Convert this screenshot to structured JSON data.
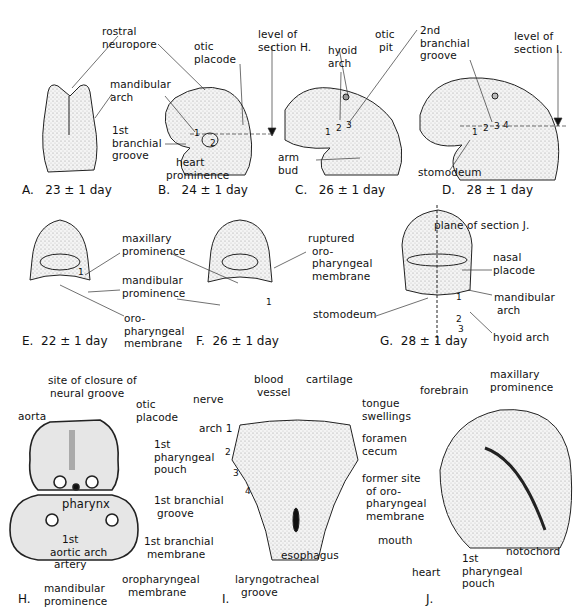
{
  "figure": {
    "panels": [
      {
        "id": "A",
        "caption": "A.",
        "age": "23 ± 1 day",
        "labels": {
          "rostral_neuropore": [
            "rostral",
            "neuropore"
          ],
          "mandibular_arch": [
            "mandibular",
            "arch"
          ]
        }
      },
      {
        "id": "B",
        "caption": "B.",
        "age": "24 ± 1 day",
        "labels": {
          "otic_placode": [
            "otic",
            "placode"
          ],
          "level_of_section": [
            "level of",
            "section H."
          ],
          "first_branchial_groove": [
            "1st",
            "branchial",
            "groove"
          ],
          "heart_prominence": [
            "heart",
            "prominence"
          ]
        },
        "arch_numbers": [
          "1",
          "2"
        ]
      },
      {
        "id": "C",
        "caption": "C.",
        "age": "26 ± 1 day",
        "labels": {
          "hyoid_arch": [
            "hyoid",
            "arch"
          ],
          "otic_pit": [
            "otic",
            "pit"
          ],
          "arm_bud": [
            "arm",
            "bud"
          ]
        },
        "arch_numbers": [
          "1",
          "2",
          "3"
        ]
      },
      {
        "id": "D",
        "caption": "D.",
        "age": "28 ± 1 day",
        "labels": {
          "second_branchial_groove": [
            "2nd",
            "branchial",
            "groove"
          ],
          "level_of_section": [
            "level of",
            "section I."
          ],
          "stomodeum": "stomodeum"
        },
        "arch_numbers": [
          "1",
          "2",
          "3",
          "4"
        ]
      },
      {
        "id": "E",
        "caption": "E.",
        "age": "22 ± 1 day",
        "labels": {
          "maxillary_prominence": [
            "maxillary",
            "prominence"
          ],
          "mandibular_prominence": [
            "mandibular",
            "prominence"
          ],
          "oropharyngeal_membrane": [
            "oro-",
            "pharyngeal",
            "membrane"
          ]
        },
        "arch_numbers": [
          "1"
        ]
      },
      {
        "id": "F",
        "caption": "F.",
        "age": "26 ± 1 day",
        "labels": {
          "ruptured_membrane": [
            "ruptured",
            "oro-",
            "pharyngeal",
            "membrane"
          ]
        },
        "arch_numbers": [
          "1"
        ]
      },
      {
        "id": "G",
        "caption": "G.",
        "age": "28 ± 1 day",
        "labels": {
          "plane_of_section": "plane   of section J.",
          "nasal_placode": [
            "nasal",
            "placode"
          ],
          "mandibular_arch": [
            "mandibular",
            "arch"
          ],
          "stomodeum": "stomodeum",
          "hyoid_arch": "hyoid arch"
        },
        "arch_numbers": [
          "1",
          "2",
          "3"
        ]
      },
      {
        "id": "H",
        "caption": "H.",
        "labels": {
          "site_closure": [
            "site of closure of",
            "neural groove"
          ],
          "aorta": "aorta",
          "otic_placode": [
            "otic",
            "placode"
          ],
          "first_pharyngeal_pouch": [
            "1st",
            "pharyngeal",
            "pouch"
          ],
          "pharynx": "pharynx",
          "first_branchial_groove": [
            "1st branchial",
            "groove"
          ],
          "first_branchial_membrane": [
            "1st branchial",
            "membrane"
          ],
          "first_aortic_arch_artery": [
            "1st",
            "aortic arch",
            "artery"
          ],
          "oropharyngeal_membrane": [
            "oropharyngeal",
            "membrane"
          ],
          "mandibular_prominence": [
            "mandibular",
            "prominence"
          ]
        }
      },
      {
        "id": "I",
        "caption": "I.",
        "labels": {
          "nerve": "nerve",
          "blood_vessel": [
            "blood",
            "vessel"
          ],
          "cartilage": "cartilage",
          "tongue_swellings": [
            "tongue",
            "swellings"
          ],
          "arch": "arch 1",
          "foramen_cecum": [
            "foramen",
            "cecum"
          ],
          "esophagus": "esophagus",
          "laryngotracheal_groove": [
            "laryngotracheal",
            "groove"
          ]
        },
        "arch_numbers": [
          "2",
          "3",
          "4"
        ]
      },
      {
        "id": "J",
        "caption": "J.",
        "labels": {
          "forebrain": "forebrain",
          "maxillary_prominence": [
            "maxillary",
            "prominence"
          ],
          "former_site": [
            "former site",
            "of oro-",
            "pharyngeal",
            "membrane"
          ],
          "mouth": "mouth",
          "heart": "heart",
          "first_pharyngeal_pouch": [
            "1st",
            "pharyngeal",
            "pouch"
          ],
          "notochord": "notochord"
        }
      }
    ]
  }
}
